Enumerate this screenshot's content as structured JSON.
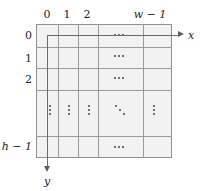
{
  "figure": {
    "kind": "image-coordinate-grid-diagram",
    "fill_color": "#f2f2f2",
    "grid_line_color": "#9a9a9a",
    "border_color": "#8f8f8f",
    "axis_color": "#6b6b6b",
    "text_color": "#1d1d1d"
  },
  "column_labels": [
    {
      "name": "col-0",
      "text": "0",
      "italic": false
    },
    {
      "name": "col-1",
      "text": "1",
      "italic": false
    },
    {
      "name": "col-2",
      "text": "2",
      "italic": false
    },
    {
      "name": "col-w-minus-1",
      "text": "w − 1",
      "italic": true
    }
  ],
  "row_labels": [
    {
      "name": "row-0",
      "text": "0",
      "italic": false
    },
    {
      "name": "row-1",
      "text": "1",
      "italic": false
    },
    {
      "name": "row-2",
      "text": "2",
      "italic": false
    },
    {
      "name": "row-h-minus-1",
      "text": "h − 1",
      "italic": true
    }
  ],
  "axes": {
    "x": {
      "label": "x",
      "direction": "right"
    },
    "y": {
      "label": "y",
      "direction": "down"
    }
  },
  "ellipses": {
    "horizontal": "···",
    "vertical": "⋮",
    "diagonal": "⋱",
    "horizontal_count": 4,
    "vertical_count": 5,
    "diagonal_count": 1
  },
  "labels_text": {
    "col0": "0",
    "col1": "1",
    "col2": "2",
    "colw": "w − 1",
    "row0": "0",
    "row1": "1",
    "row2": "2",
    "rowh": "h − 1",
    "xaxis": "x",
    "yaxis": "y"
  }
}
